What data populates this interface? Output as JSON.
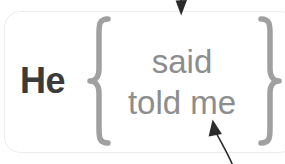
{
  "diagram": {
    "type": "grammar-alternation-box",
    "subject": "He",
    "brace_open": "{",
    "brace_close": "}",
    "options": [
      "said",
      "told me"
    ],
    "annotations": [
      {
        "name": "top-pointer",
        "direction": "down",
        "target": "options-group",
        "label": ""
      },
      {
        "name": "bottom-pointer",
        "direction": "up-left",
        "target": "told-me-option",
        "label": ""
      }
    ],
    "colors": {
      "subject_text": "#3b3b3b",
      "option_text": "#8d8d8d",
      "brace": "#a0a0a0",
      "box_border": "#ececec",
      "arrow": "#2b2b2b",
      "background": "#ffffff"
    }
  }
}
